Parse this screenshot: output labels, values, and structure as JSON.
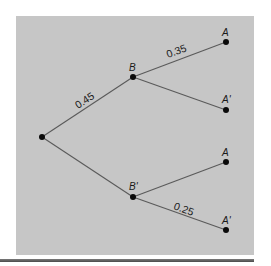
{
  "diagram": {
    "type": "probability-tree",
    "colors": {
      "panel_background": "#c6c6c6",
      "edge": "#5a5a5a",
      "node": "#0a0a0a",
      "text": "#1a1a1a",
      "rule": "#4a4a4a"
    },
    "nodes": [
      {
        "id": "root",
        "label": "",
        "x": 42,
        "y": 137
      },
      {
        "id": "B",
        "label": "B",
        "x": 133,
        "y": 77
      },
      {
        "id": "B_prime",
        "label": "B'",
        "x": 133,
        "y": 197
      },
      {
        "id": "B_A",
        "label": "A",
        "x": 226,
        "y": 42
      },
      {
        "id": "B_A_prime",
        "label": "A'",
        "x": 226,
        "y": 110
      },
      {
        "id": "Bp_A",
        "label": "A",
        "x": 226,
        "y": 162
      },
      {
        "id": "Bp_A_prime",
        "label": "A'",
        "x": 226,
        "y": 230
      }
    ],
    "edges": [
      {
        "from": "root",
        "to": "B",
        "probability": "0.45"
      },
      {
        "from": "root",
        "to": "B_prime",
        "probability": ""
      },
      {
        "from": "B",
        "to": "B_A",
        "probability": "0.35"
      },
      {
        "from": "B",
        "to": "B_A_prime",
        "probability": ""
      },
      {
        "from": "B_prime",
        "to": "Bp_A",
        "probability": ""
      },
      {
        "from": "B_prime",
        "to": "Bp_A_prime",
        "probability": "0.25"
      }
    ],
    "labels": {
      "B": "B",
      "B_prime": "B'",
      "B_A": "A",
      "B_A_prime": "A'",
      "Bp_A": "A",
      "Bp_A_prime": "A'",
      "p_root_B": "0.45",
      "p_B_A": "0.35",
      "p_Bp_Aprime": "0.25"
    }
  }
}
